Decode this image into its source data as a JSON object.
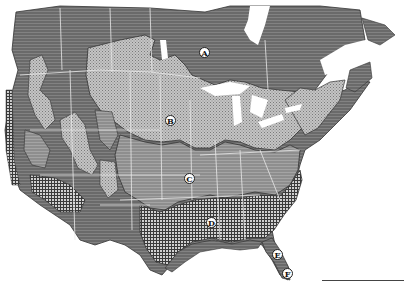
{
  "map": {
    "type": "vegetation/biome region map of North America (USA and southern Canada)",
    "colors": {
      "region_a_boreal": "#6e6e6e",
      "region_b_dotted": "#b4b4b4",
      "region_c_striped": "#8c8c8c",
      "region_d_crosshatch": "#5a5a5a",
      "region_ef_coastal": "#7a7a7a",
      "mountain_zones": "#9a9a9a",
      "boundaries": "#e8e8e8",
      "water": "#ffffff"
    },
    "labels": [
      {
        "id": "A",
        "x": 204,
        "y": 52
      },
      {
        "id": "B",
        "x": 170,
        "y": 120
      },
      {
        "id": "C",
        "x": 189,
        "y": 178
      },
      {
        "id": "D",
        "x": 211,
        "y": 222
      },
      {
        "id": "E",
        "x": 277,
        "y": 254
      },
      {
        "id": "F",
        "x": 287,
        "y": 273
      }
    ]
  }
}
